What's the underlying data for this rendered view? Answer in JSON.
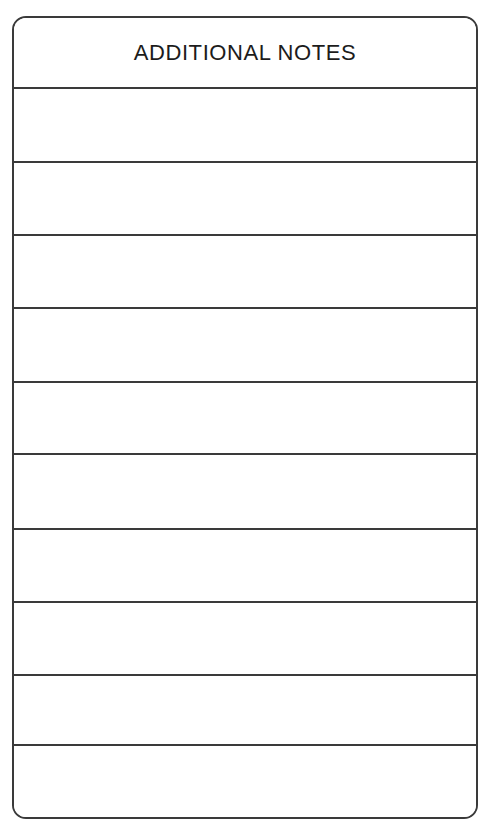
{
  "page": {
    "background_color": "#ffffff",
    "width": 492,
    "height": 828
  },
  "form": {
    "name": "additional-notes-form",
    "border_color": "#3a3a3a",
    "fill_color": "#ffffff",
    "corner_radius_px": 14,
    "header": {
      "title": "ADDITIONAL NOTES",
      "height_px": 71,
      "text_color": "#1c1c1c"
    },
    "rows": [
      {
        "index": 1,
        "value": "",
        "top": 0,
        "height": 74,
        "ruled": true
      },
      {
        "index": 2,
        "value": "",
        "top": 74,
        "height": 73,
        "ruled": true
      },
      {
        "index": 3,
        "value": "",
        "top": 147,
        "height": 73,
        "ruled": true
      },
      {
        "index": 4,
        "value": "",
        "top": 220,
        "height": 74,
        "ruled": true
      },
      {
        "index": 5,
        "value": "",
        "top": 294,
        "height": 72,
        "ruled": true
      },
      {
        "index": 6,
        "value": "",
        "top": 366,
        "height": 75,
        "ruled": true
      },
      {
        "index": 7,
        "value": "",
        "top": 441,
        "height": 73,
        "ruled": true
      },
      {
        "index": 8,
        "value": "",
        "top": 514,
        "height": 73,
        "ruled": true
      },
      {
        "index": 9,
        "value": "",
        "top": 587,
        "height": 70,
        "ruled": true
      },
      {
        "index": 10,
        "value": "",
        "top": 657,
        "height": 73,
        "ruled": false
      }
    ]
  }
}
